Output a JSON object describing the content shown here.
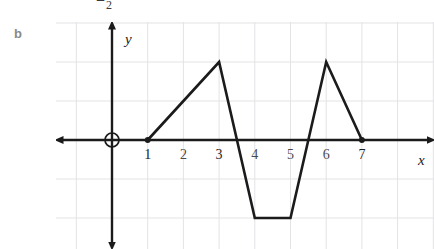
{
  "page": {
    "background_color": "#ffffff",
    "cut_off_fragment": "=",
    "cut_off_fragment_subscript": "2",
    "part_label": "b"
  },
  "figure": {
    "name": "piecewise-linear-graph",
    "grid": {
      "visible": true,
      "color": "#e3e3e6",
      "x_spacing_px": 35.7,
      "y_spacing_px": 39
    },
    "axes": {
      "x_axis_label": "x",
      "y_axis_label": "y",
      "axis_color": "#1b1b1b",
      "x_axis_y_px": 118,
      "y_axis_x_px": 56,
      "arrowheads": [
        "left",
        "right",
        "up",
        "down"
      ]
    },
    "origin_marker": {
      "type": "open-circle",
      "label": "O",
      "cx": 56,
      "cy": 118,
      "r": 7
    },
    "x_ticks": [
      {
        "label": "1",
        "value": 1,
        "emphasis": "dark"
      },
      {
        "label": "2",
        "value": 2,
        "emphasis": "light"
      },
      {
        "label": "3",
        "value": 3,
        "emphasis": "dark"
      },
      {
        "label": "4",
        "value": 4,
        "emphasis": "light"
      },
      {
        "label": "5",
        "value": 5,
        "emphasis": "light"
      },
      {
        "label": "6",
        "value": 6,
        "emphasis": "light"
      },
      {
        "label": "7",
        "value": 7,
        "emphasis": "dark"
      }
    ],
    "y_ticks": []
  },
  "chart_data": {
    "type": "line",
    "title": "",
    "subtitle": "",
    "xlabel": "x",
    "ylabel": "y",
    "xlim": [
      -1.6,
      9
    ],
    "ylim": [
      -2.9,
      3.1
    ],
    "grid": true,
    "legend": "none",
    "series": [
      {
        "name": "piecewise linear curve",
        "color": "#1b1b1b",
        "line_width_px": 2.6,
        "x": [
          1,
          3,
          4,
          5,
          6,
          7
        ],
        "y": [
          0,
          2,
          -2,
          -2,
          2,
          0
        ],
        "points": [
          {
            "x": 1,
            "y": 0
          },
          {
            "x": 3,
            "y": 2
          },
          {
            "x": 4,
            "y": -2
          },
          {
            "x": 5,
            "y": -2
          },
          {
            "x": 6,
            "y": 2
          },
          {
            "x": 7,
            "y": 0
          }
        ]
      }
    ],
    "endpoint_markers": [
      {
        "x": 1,
        "y": 0,
        "style": "filled-dot"
      },
      {
        "x": 7,
        "y": 0,
        "style": "filled-dot"
      }
    ],
    "annotations": []
  }
}
